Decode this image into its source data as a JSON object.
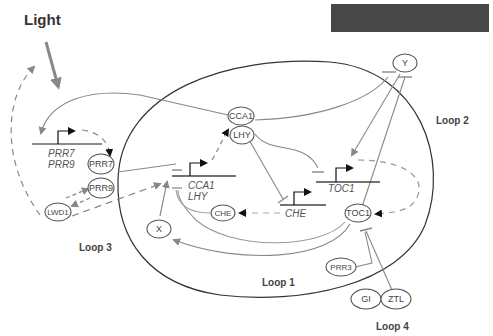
{
  "diagram": {
    "title": "Light",
    "redacted_box_color": "#444444",
    "loops": [
      {
        "id": "loop1",
        "label": "Loop 1"
      },
      {
        "id": "loop2",
        "label": "Loop 2"
      },
      {
        "id": "loop3",
        "label": "Loop 3"
      },
      {
        "id": "loop4",
        "label": "Loop 4"
      }
    ],
    "proteins": {
      "cca1": "CCA1",
      "lhy": "LHY",
      "y": "Y",
      "x": "X",
      "prr7": "PRR7",
      "prr9": "PRR9",
      "lwd1": "LWD1",
      "che": "CHE",
      "toc1": "TOC1",
      "prr3": "PRR3",
      "gi": "GI",
      "ztl": "ZTL"
    },
    "genes": {
      "prr7": "PRR7",
      "prr9": "PRR9",
      "cca1": "CCA1",
      "lhy": "LHY",
      "toc1": "TOC1",
      "che": "CHE"
    },
    "edges": [
      {
        "from": "Light",
        "to": "PRR7/PRR9 gene",
        "type": "activation"
      },
      {
        "from": "PRR7/PRR9 gene",
        "to": "PRR7",
        "type": "translation"
      },
      {
        "from": "CCA1",
        "to": "PRR7/PRR9 gene",
        "type": "activation"
      },
      {
        "from": "PRR7",
        "to": "CCA1/LHY gene",
        "type": "inhibition"
      },
      {
        "from": "PRR9",
        "to": "CCA1/LHY gene",
        "type": "inhibition"
      },
      {
        "from": "LWD1",
        "to": "PRR9",
        "type": "activation"
      },
      {
        "from": "PRR9",
        "to": "LWD1",
        "type": "activation"
      },
      {
        "from": "LWD1",
        "to": "CCA1/LHY gene",
        "type": "activation"
      },
      {
        "from": "LWD1",
        "to": "Light",
        "type": "activation"
      },
      {
        "from": "X",
        "to": "CCA1/LHY gene",
        "type": "activation"
      },
      {
        "from": "CCA1/LHY gene",
        "to": "CCA1/LHY",
        "type": "translation"
      },
      {
        "from": "CCA1",
        "to": "Y gene",
        "type": "inhibition"
      },
      {
        "from": "LHY",
        "to": "TOC1 gene",
        "type": "inhibition"
      },
      {
        "from": "LHY",
        "to": "CHE gene",
        "type": "inhibition"
      },
      {
        "from": "CHE gene",
        "to": "CHE",
        "type": "translation"
      },
      {
        "from": "CHE",
        "to": "CCA1/LHY gene",
        "type": "inhibition"
      },
      {
        "from": "Y",
        "to": "TOC1 gene",
        "type": "activation"
      },
      {
        "from": "TOC1",
        "to": "Y gene",
        "type": "inhibition"
      },
      {
        "from": "TOC1 gene",
        "to": "TOC1",
        "type": "translation"
      },
      {
        "from": "TOC1",
        "to": "X",
        "type": "activation"
      },
      {
        "from": "TOC1",
        "to": "CCA1/LHY gene",
        "type": "inhibition"
      },
      {
        "from": "PRR3",
        "to": "TOC1",
        "type": "inhibition"
      },
      {
        "from": "ZTL",
        "to": "TOC1",
        "type": "inhibition"
      }
    ]
  }
}
